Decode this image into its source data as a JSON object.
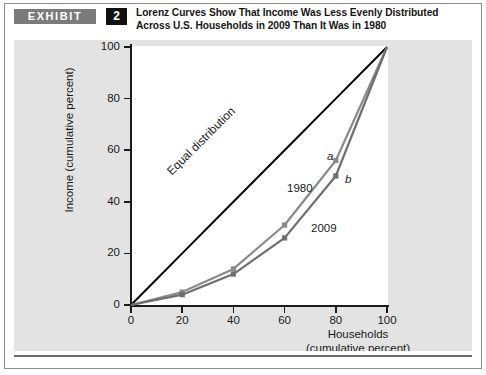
{
  "exhibit": {
    "tag_label": "EXHIBIT",
    "number": "2",
    "title": "Lorenz Curves Show That Income Was Less Evenly Distributed Across U.S. Households in 2009 Than It Was in 1980"
  },
  "colors": {
    "panel_background": "#e3e3e3",
    "plot_background": "#ffffff",
    "axis": "#1a1a1a",
    "equal_distribution_line": "#000000",
    "curve_1980": "#8a8a8a",
    "curve_2009": "#6e6e6e",
    "tag_background": "#7b7b7b",
    "number_background": "#101010"
  },
  "chart_data": {
    "type": "line",
    "title": "Lorenz Curves Show That Income Was Less Evenly Distributed Across U.S. Households in 2009 Than It Was in 1980",
    "xlabel": "Households (cumulative percent)",
    "xlabel_line1": "Households",
    "xlabel_line2": "(cumulative percent)",
    "ylabel": "Income (cumulative percent)",
    "xlim": [
      0,
      100
    ],
    "ylim": [
      0,
      100
    ],
    "grid": false,
    "legend_position": "inline-annotations",
    "xticks": [
      0,
      20,
      40,
      60,
      80,
      100
    ],
    "xtick_labels": [
      "0",
      "20",
      "40",
      "60",
      "80",
      "100"
    ],
    "yticks": [
      0,
      20,
      40,
      60,
      80,
      100
    ],
    "ytick_labels": [
      "0",
      "20",
      "40",
      "60",
      "80",
      "100"
    ],
    "x": [
      0,
      20,
      40,
      60,
      80,
      100
    ],
    "series": [
      {
        "name": "Equal distribution",
        "label": "Equal distribution",
        "values": [
          0,
          20,
          40,
          60,
          80,
          100
        ],
        "color": "#000000",
        "markers": false
      },
      {
        "name": "1980",
        "label": "1980",
        "values": [
          0,
          5,
          14,
          31,
          56,
          100
        ],
        "color": "#8a8a8a",
        "markers": true,
        "point_label": "a",
        "point_label_at_x": 80
      },
      {
        "name": "2009",
        "label": "2009",
        "values": [
          0,
          4,
          12,
          26,
          50,
          100
        ],
        "color": "#6e6e6e",
        "markers": true,
        "point_label": "b",
        "point_label_at_x": 80
      }
    ],
    "annotations": [
      {
        "text": "Equal distribution",
        "x": 38,
        "y": 44
      },
      {
        "text": "1980",
        "x": 62,
        "y": 48
      },
      {
        "text": "2009",
        "x": 72,
        "y": 33
      },
      {
        "text": "a",
        "x": 78,
        "y": 59
      },
      {
        "text": "b",
        "x": 85,
        "y": 50
      }
    ]
  }
}
